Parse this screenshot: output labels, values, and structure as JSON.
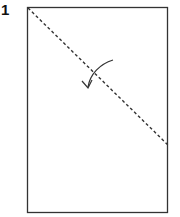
{
  "step": {
    "number": "1"
  },
  "diagram": {
    "paper": {
      "x": 27,
      "y": 7,
      "width": 141,
      "height": 206,
      "stroke": "#333333"
    },
    "fold_line": {
      "x1": 28,
      "y1": 8,
      "x2": 168,
      "y2": 145,
      "style": "dashed",
      "stroke": "#333333"
    },
    "fold_arrow": {
      "direction": "fold-down-left",
      "stroke": "#333333"
    }
  }
}
